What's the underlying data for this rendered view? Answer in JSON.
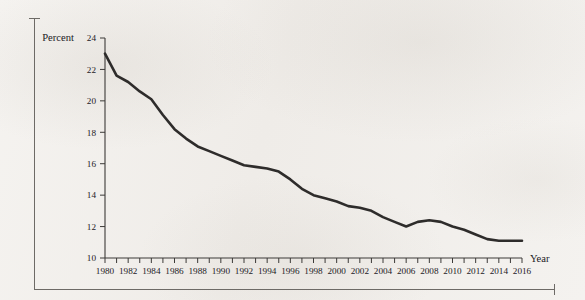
{
  "figure": {
    "axis_unit_label": "Percent",
    "x_axis_title": "Year"
  },
  "chart_data": {
    "type": "line",
    "title": "",
    "subtitle": "",
    "xlabel": "Year",
    "ylabel": "Percent",
    "ylim": [
      10,
      24
    ],
    "xlim": [
      1980,
      2016
    ],
    "grid": false,
    "legend": "none",
    "y_ticks": [
      10,
      12,
      14,
      16,
      18,
      20,
      22,
      24
    ],
    "y_tick_labels": [
      "10",
      "12",
      "14",
      "16",
      "18",
      "20",
      "22",
      "24"
    ],
    "x_tick_step_minor": 1,
    "x_tick_step_labeled": 2,
    "x_tick_labels": [
      "1980",
      "1982",
      "1984",
      "1986",
      "1988",
      "1990",
      "1992",
      "1994",
      "1996",
      "1998",
      "2000",
      "2002",
      "2004",
      "2006",
      "2008",
      "2010",
      "2012",
      "2014",
      "2016"
    ],
    "line_color": "#2e2c2b",
    "series": [
      {
        "name": "Percent",
        "x": [
          1980,
          1981,
          1982,
          1983,
          1984,
          1985,
          1986,
          1987,
          1988,
          1989,
          1990,
          1991,
          1992,
          1993,
          1994,
          1995,
          1996,
          1997,
          1998,
          1999,
          2000,
          2001,
          2002,
          2003,
          2004,
          2005,
          2006,
          2007,
          2008,
          2009,
          2010,
          2011,
          2012,
          2013,
          2014,
          2015,
          2016
        ],
        "values": [
          23.0,
          21.6,
          21.2,
          20.6,
          20.1,
          19.1,
          18.2,
          17.6,
          17.1,
          16.8,
          16.5,
          16.2,
          15.9,
          15.8,
          15.7,
          15.5,
          15.0,
          14.4,
          14.0,
          13.8,
          13.6,
          13.3,
          13.2,
          13.0,
          12.6,
          12.3,
          12.0,
          12.3,
          12.4,
          12.3,
          12.0,
          11.8,
          11.5,
          11.2,
          11.1,
          11.1,
          11.1
        ]
      }
    ]
  }
}
